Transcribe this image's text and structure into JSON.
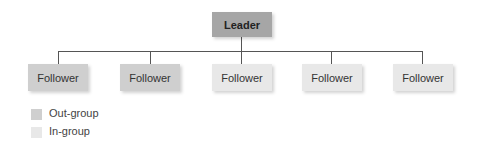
{
  "diagram": {
    "leader": {
      "label": "Leader"
    },
    "followers": [
      {
        "label": "Follower",
        "group": "out"
      },
      {
        "label": "Follower",
        "group": "out"
      },
      {
        "label": "Follower",
        "group": "in"
      },
      {
        "label": "Follower",
        "group": "in"
      },
      {
        "label": "Follower",
        "group": "in"
      }
    ],
    "legend": [
      {
        "label": "Out-group",
        "color": "#cfcfcf"
      },
      {
        "label": "In-group",
        "color": "#e8e8e8"
      }
    ]
  }
}
